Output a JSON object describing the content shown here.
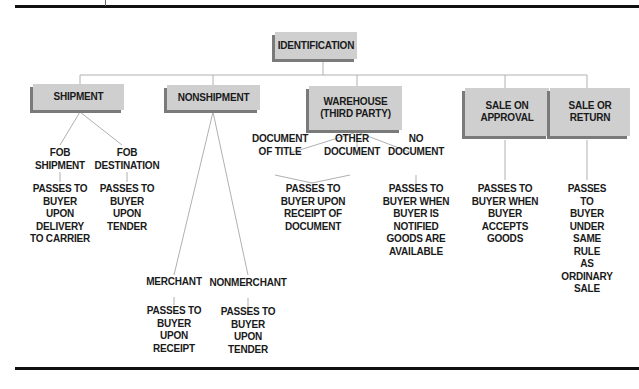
{
  "diagram": {
    "root": {
      "label": "IDENTIFICATION"
    },
    "categories": [
      {
        "label": "SHIPMENT",
        "children": [
          {
            "label": "FOB\nSHIPMENT",
            "result": "PASSES TO\nBUYER\nUPON\nDELIVERY\nTO CARRIER"
          },
          {
            "label": "FOB\nDESTINATION",
            "result": "PASSES TO\nBUYER\nUPON\nTENDER"
          }
        ]
      },
      {
        "label": "NONSHIPMENT",
        "children": [
          {
            "label": "MERCHANT",
            "result": "PASSES TO\nBUYER\nUPON\nRECEIPT"
          },
          {
            "label": "NONMERCHANT",
            "result": "PASSES TO\nBUYER\nUPON\nTENDER"
          }
        ]
      },
      {
        "label": "WAREHOUSE\n(THIRD PARTY)",
        "children": [
          {
            "label": "DOCUMENT\nOF TITLE"
          },
          {
            "label": "OTHER\nDOCUMENT"
          },
          {
            "label": "NO\nDOCUMENT",
            "result": "PASSES TO\nBUYER WHEN\nBUYER IS\nNOTIFIED\nGOODS ARE\nAVAILABLE"
          }
        ],
        "shared_result": "PASSES TO\nBUYER UPON\nRECEIPT OF\nDOCUMENT"
      },
      {
        "label": "SALE ON\nAPPROVAL",
        "result": "PASSES TO\nBUYER WHEN\nBUYER\nACCEPTS\nGOODS"
      },
      {
        "label": "SALE OR\nRETURN",
        "result": "PASSES TO\nBUYER UNDER\nSAME RULE\nAS ORDINARY\nSALE"
      }
    ]
  },
  "colors": {
    "box_fill": "#cfcfcf",
    "box_shadow": "#7a7a7a",
    "line": "#b0b0b0",
    "rule": "#111111"
  }
}
